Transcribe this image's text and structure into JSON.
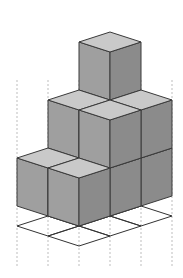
{
  "diagram": {
    "type": "isometric-cube-stack",
    "colors": {
      "top_face": "#c9c9c9",
      "left_face": "#9f9f9f",
      "right_face": "#8b8b8b",
      "edge": "#3a3a3a",
      "grid_line": "#333333",
      "projection_line": "#bdbdbd",
      "background": "#ffffff"
    },
    "cube_columns": [
      {
        "row": "back",
        "col": 0,
        "height": 1
      },
      {
        "row": "back",
        "col": 1,
        "height": 2
      },
      {
        "row": "back",
        "col": 2,
        "height": 3
      },
      {
        "row": "front",
        "col": 0,
        "height": 1
      },
      {
        "row": "front",
        "col": 1,
        "height": 2
      },
      {
        "row": "front",
        "col": 2,
        "height": 2
      }
    ],
    "base_grid": {
      "rows": 2,
      "cols": 3
    },
    "total_cubes": 11
  }
}
